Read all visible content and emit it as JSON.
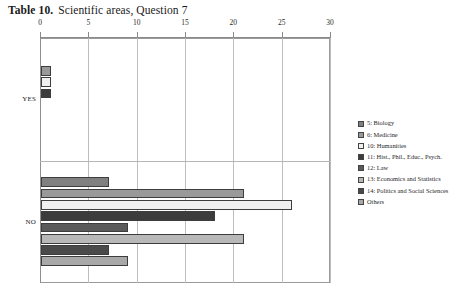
{
  "title": {
    "label": "Table 10.",
    "text": "Scientific areas, Question 7"
  },
  "chart_data": {
    "type": "bar",
    "orientation": "horizontal",
    "xlabel": "",
    "ylabel": "",
    "xlim": [
      0,
      30
    ],
    "xticks": [
      "0",
      "5",
      "10",
      "15",
      "20",
      "25",
      "30"
    ],
    "xtick_values": [
      0,
      5,
      10,
      15,
      20,
      25,
      30
    ],
    "grid": true,
    "axis_position": "top",
    "legend_position": "right",
    "categories": [
      "YES",
      "NO"
    ],
    "series": [
      {
        "name": "5: Biology",
        "color": "#808080",
        "values": [
          0,
          7
        ]
      },
      {
        "name": "6: Medicine",
        "color": "#999999",
        "values": [
          1,
          21
        ]
      },
      {
        "name": "10: Humanities",
        "color": "#f0f0f0",
        "values": [
          1,
          26
        ]
      },
      {
        "name": "11: Hist., Phil., Educ., Psych.",
        "color": "#3c3c3c",
        "values": [
          1,
          18
        ]
      },
      {
        "name": "12: Law",
        "color": "#5a5a5a",
        "values": [
          0,
          9
        ]
      },
      {
        "name": "13: Economics and Statistics",
        "color": "#b8b8b8",
        "values": [
          0,
          21
        ]
      },
      {
        "name": "14: Politics and Social Sciences",
        "color": "#4a4a4a",
        "values": [
          0,
          7
        ]
      },
      {
        "name": "Others",
        "color": "#a8a8a8",
        "values": [
          0,
          9
        ]
      }
    ]
  }
}
